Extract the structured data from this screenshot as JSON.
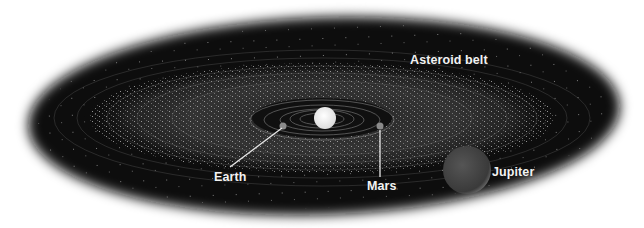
{
  "diagram": {
    "background_color": "#ffffff",
    "space_color": "#0a0a0a",
    "labels": {
      "asteroid_belt": "Asteroid belt",
      "earth": "Earth",
      "mars": "Mars",
      "jupiter": "Jupiter"
    },
    "bodies": [
      {
        "name": "Sun",
        "cx": 325,
        "cy": 118,
        "r": 11,
        "color": "#f4f4f4"
      },
      {
        "name": "Earth",
        "cx": 283,
        "cy": 126,
        "r": 3.5,
        "color": "#8a8a8a"
      },
      {
        "name": "Mars",
        "cx": 380,
        "cy": 126,
        "r": 3.5,
        "color": "#8a8a8a"
      },
      {
        "name": "Jupiter",
        "cx": 467,
        "cy": 170,
        "r": 24,
        "color": "#4a4a4a"
      }
    ]
  }
}
